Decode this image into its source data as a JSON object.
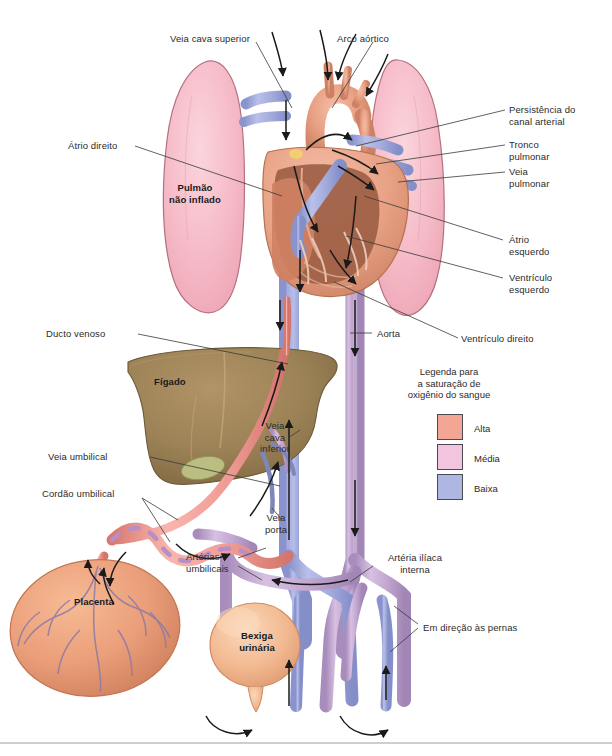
{
  "figure": {
    "width": 612,
    "height": 756,
    "background": "#ffffff"
  },
  "labels": {
    "veia_cava_superior": "Veia cava superior",
    "arco_aortico": "Arco aórtico",
    "atrio_direito": "Átrio direito",
    "pulmao_nao_inflado": "Pulmão\nnão inflado",
    "persistencia_canal_arterial": "Persistência do\ncanal arterial",
    "tronco_pulmonar": "Tronco\npulmonar",
    "veia_pulmonar": "Veia\npulmonar",
    "atrio_esquerdo": "Átrio\nesquerdo",
    "ventriculo_esquerdo": "Ventrículo\nesquerdo",
    "ventriculo_direito": "Ventrículo direito",
    "ducto_venoso": "Ducto venoso",
    "figado": "Fígado",
    "aorta": "Aorta",
    "veia_cava_inferior": "Veia\ncava\ninferior",
    "veia_umbilical": "Veia umbilical",
    "cordao_umbilical": "Cordão umbilical",
    "veia_porta": "Veia\nporta",
    "arterias_umbilicais": "Artérias\numbilicais",
    "placenta": "Placenta",
    "bexiga_urinaria": "Bexiga\nurinária",
    "arteria_iliaca_interna": "Artéria ilíaca\ninterna",
    "em_direcao_as_pernas": "Em direção às pernas"
  },
  "legend": {
    "title": "Legenda para\na saturação de\noxigênio do sangue",
    "items": [
      {
        "label": "Alta",
        "color": "#f2a693"
      },
      {
        "label": "Média",
        "color": "#f3c4dd"
      },
      {
        "label": "Baixa",
        "color": "#aeb6e2"
      }
    ]
  },
  "palette": {
    "lung": "#f5b9c6",
    "lung_edge": "#b5707f",
    "liver": "#9c8256",
    "liver_edge": "#6d5a37",
    "gallbladder": "#bcbd80",
    "heart_muscle": "#e8a184",
    "heart_chamber": "#9d5f45",
    "heart_wall": "#f0b79e",
    "vein_blue": "#a3abdb",
    "artery_purple": "#c0a4cf",
    "artery_pink": "#ef9a94",
    "placenta": "#eb9f7a",
    "placenta_vessel": "#8c7aa6",
    "bladder": "#f2b991",
    "arrow": "#1a1a1a",
    "leader": "#3a3a3a",
    "divider": "#9aa0a6"
  }
}
